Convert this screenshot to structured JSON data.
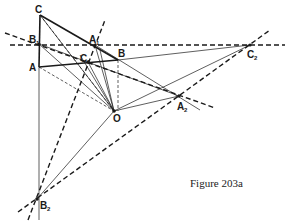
{
  "caption": "Figure 203a",
  "colors": {
    "ink": "#1a1a1a",
    "background": "#ffffff"
  },
  "points": {
    "C": {
      "label": "C",
      "sub": "",
      "x": 40,
      "y": 15
    },
    "B1": {
      "label": "B",
      "sub": "1",
      "x": 39,
      "y": 44
    },
    "A": {
      "label": "A",
      "sub": "",
      "x": 39,
      "y": 67
    },
    "A1": {
      "label": "A",
      "sub": "1",
      "x": 95,
      "y": 45
    },
    "B": {
      "label": "B",
      "sub": "",
      "x": 118,
      "y": 60
    },
    "C1": {
      "label": "C",
      "sub": "1",
      "x": 88,
      "y": 62
    },
    "O": {
      "label": "O",
      "sub": "",
      "x": 114,
      "y": 111
    },
    "A2": {
      "label": "A",
      "sub": "2",
      "x": 179,
      "y": 96
    },
    "C2": {
      "label": "C",
      "sub": "2",
      "x": 250,
      "y": 45
    },
    "B2": {
      "label": "B",
      "sub": "2",
      "x": 37,
      "y": 199
    }
  }
}
